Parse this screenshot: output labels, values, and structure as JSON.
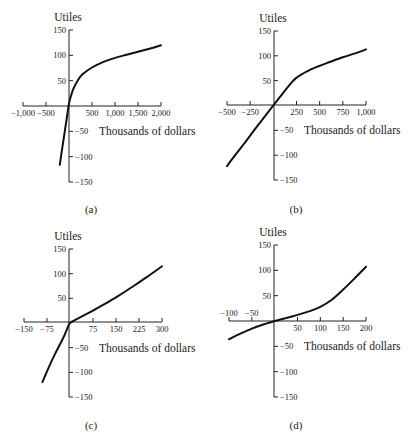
{
  "figure": {
    "panels": [
      "(a)",
      "(b)",
      "(c)",
      "(d)"
    ]
  },
  "chart_data": [
    {
      "type": "line",
      "panel_label": "(a)",
      "ylabel": "Utiles",
      "xlabel": "Thousands of dollars",
      "x_ticks": [
        -1000,
        -500,
        0,
        500,
        1000,
        1500,
        2000
      ],
      "x_tick_labels": [
        "−1,000",
        "−500",
        "",
        "500",
        "1,000",
        "1,500",
        "2,000"
      ],
      "y_ticks": [
        -150,
        -100,
        -50,
        0,
        50,
        100,
        150
      ],
      "y_tick_labels": [
        "−150",
        "−100",
        "−50",
        "",
        "50",
        "100",
        "150"
      ],
      "xlim": [
        -1000,
        2000
      ],
      "ylim": [
        -150,
        150
      ],
      "grid": false,
      "neg_labels_above_axis": false,
      "series": [
        {
          "name": "utility",
          "x": [
            -200,
            -150,
            -100,
            -50,
            0,
            50,
            100,
            200,
            300,
            500,
            750,
            1000,
            1250,
            1500,
            1750,
            2000
          ],
          "y": [
            -116,
            -85,
            -55,
            -25,
            5,
            22,
            35,
            52,
            63,
            76,
            87,
            95,
            101,
            107,
            113,
            120
          ]
        }
      ]
    },
    {
      "type": "line",
      "panel_label": "(b)",
      "ylabel": "Utiles",
      "xlabel": "Thousands of dollars",
      "x_ticks": [
        -500,
        -250,
        0,
        250,
        500,
        750,
        1000
      ],
      "x_tick_labels": [
        "−500",
        "−250",
        "",
        "250",
        "500",
        "750",
        "1,000"
      ],
      "y_ticks": [
        -150,
        -100,
        -50,
        0,
        50,
        100,
        150
      ],
      "y_tick_labels": [
        "−150",
        "−100",
        "−50",
        "",
        "50",
        "100",
        "150"
      ],
      "xlim": [
        -500,
        1000
      ],
      "ylim": [
        -150,
        150
      ],
      "grid": false,
      "neg_labels_above_axis": false,
      "series": [
        {
          "name": "utility",
          "x": [
            -500,
            -400,
            -300,
            -200,
            -100,
            0,
            100,
            200,
            250,
            300,
            400,
            500,
            600,
            750,
            900,
            1000
          ],
          "y": [
            -122,
            -97,
            -73,
            -48,
            -24,
            0,
            24,
            47,
            56,
            62,
            72,
            80,
            87,
            97,
            106,
            113
          ]
        }
      ]
    },
    {
      "type": "line",
      "panel_label": "(c)",
      "ylabel": "Utiles",
      "xlabel": "Thousands of dollars",
      "x_ticks": [
        -150,
        -75,
        0,
        75,
        150,
        225,
        300
      ],
      "x_tick_labels": [
        "−150",
        "−75",
        "",
        "75",
        "150",
        "225",
        "300"
      ],
      "y_ticks": [
        -150,
        -100,
        -50,
        0,
        50,
        100,
        150
      ],
      "y_tick_labels": [
        "−150",
        "−100",
        "−50",
        "",
        "50",
        "100",
        "150"
      ],
      "xlim": [
        -150,
        300
      ],
      "ylim": [
        -150,
        150
      ],
      "grid": false,
      "neg_labels_above_axis": false,
      "series": [
        {
          "name": "utility",
          "x": [
            -90,
            -75,
            -50,
            -25,
            -10,
            0,
            25,
            50,
            75,
            100,
            150,
            200,
            250,
            300
          ],
          "y": [
            -120,
            -98,
            -64,
            -34,
            -13,
            0,
            9,
            17,
            25,
            34,
            52,
            72,
            93,
            115
          ]
        }
      ]
    },
    {
      "type": "line",
      "panel_label": "(d)",
      "ylabel": "Utiles",
      "xlabel": "Thousands of dollars",
      "x_ticks": [
        -100,
        -50,
        0,
        50,
        100,
        150,
        200
      ],
      "x_tick_labels": [
        "−100",
        "−50",
        "",
        "50",
        "100",
        "150",
        "200"
      ],
      "y_ticks": [
        -150,
        -100,
        -50,
        0,
        50,
        100,
        150
      ],
      "y_tick_labels": [
        "−150",
        "−100",
        "−50",
        "",
        "50",
        "100",
        "150"
      ],
      "xlim": [
        -100,
        200
      ],
      "ylim": [
        -150,
        150
      ],
      "grid": false,
      "neg_labels_above_axis": true,
      "series": [
        {
          "name": "utility",
          "x": [
            -100,
            -75,
            -50,
            -25,
            0,
            25,
            50,
            75,
            100,
            125,
            150,
            175,
            200
          ],
          "y": [
            -36,
            -25,
            -15,
            -7,
            0,
            6,
            12,
            19,
            28,
            42,
            62,
            84,
            107
          ]
        }
      ]
    }
  ]
}
